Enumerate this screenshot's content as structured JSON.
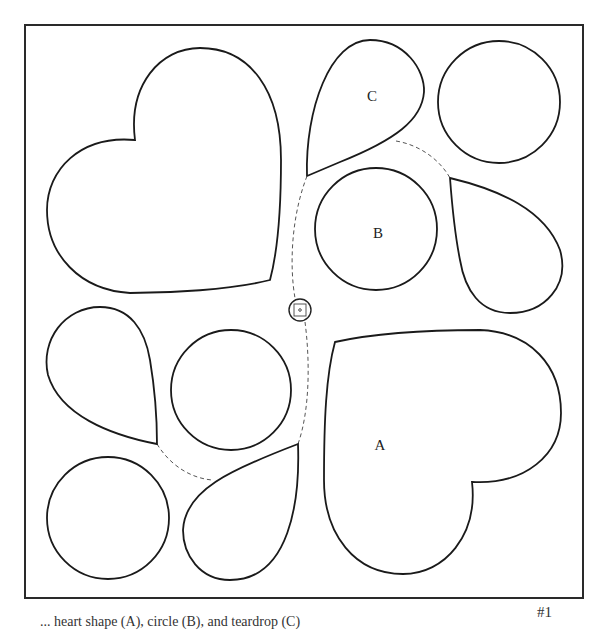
{
  "diagram": {
    "labels": {
      "a": "A",
      "b": "B",
      "c": "C"
    },
    "page_number": "#1",
    "caption": "... heart shape (A), circle (B), and teardrop (C)"
  }
}
